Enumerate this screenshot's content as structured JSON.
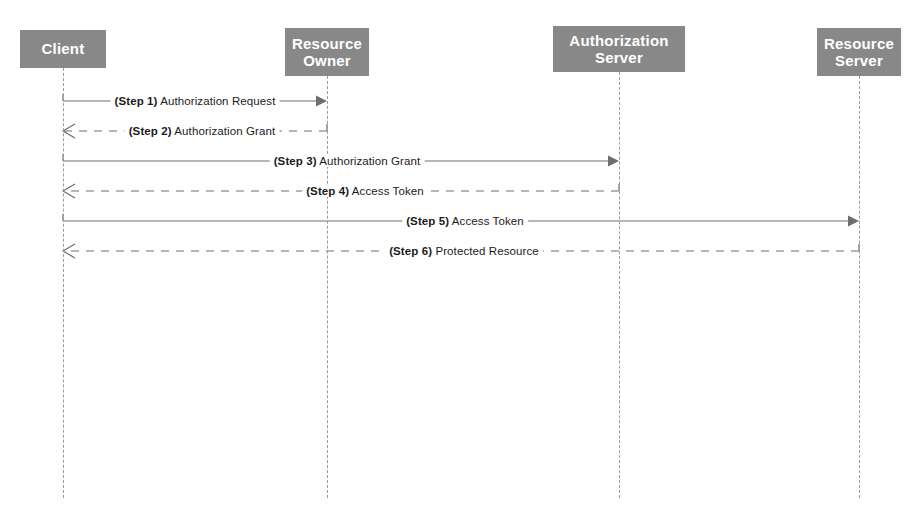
{
  "diagram": {
    "type": "uml-sequence-diagram",
    "canvas": {
      "width": 923,
      "height": 516
    },
    "colors": {
      "participant_fill": "#888888",
      "participant_text": "#ffffff",
      "line": "#6e6e6e",
      "lifeline": "#9a9a9a",
      "label_text": "#1b1b1b",
      "background": "#ffffff"
    }
  },
  "participants": [
    {
      "id": "client",
      "label": "Client",
      "x": 20,
      "y": 30,
      "width": 86,
      "height": 38,
      "lifeline_x": 63,
      "lifeline_top": 68,
      "lifeline_bottom": 498
    },
    {
      "id": "resource-owner",
      "label": "Resource\nOwner",
      "x": 285,
      "y": 28,
      "width": 84,
      "height": 48,
      "lifeline_x": 327,
      "lifeline_top": 76,
      "lifeline_bottom": 498
    },
    {
      "id": "authorization-server",
      "label": "Authorization\nServer",
      "x": 553,
      "y": 26,
      "width": 132,
      "height": 46,
      "lifeline_x": 619,
      "lifeline_top": 72,
      "lifeline_bottom": 498
    },
    {
      "id": "resource-server",
      "label": "Resource\nServer",
      "x": 817,
      "y": 28,
      "width": 84,
      "height": 48,
      "lifeline_x": 859,
      "lifeline_top": 76,
      "lifeline_bottom": 498
    }
  ],
  "messages": [
    {
      "step": "(Step 1)",
      "text": "Authorization Request",
      "from": "client",
      "to": "resource-owner",
      "x1": 63,
      "x2": 327,
      "y": 101,
      "direction": "right",
      "style": "solid",
      "arrowhead": "filled",
      "label_x": 195
    },
    {
      "step": "(Step 2)",
      "text": "Authorization Grant",
      "from": "resource-owner",
      "to": "client",
      "x1": 327,
      "x2": 63,
      "y": 131,
      "direction": "left",
      "style": "dashed",
      "arrowhead": "open",
      "label_x": 202
    },
    {
      "step": "(Step 3)",
      "text": "Authorization Grant",
      "from": "client",
      "to": "authorization-server",
      "x1": 63,
      "x2": 619,
      "y": 161,
      "direction": "right",
      "style": "solid",
      "arrowhead": "filled",
      "label_x": 347
    },
    {
      "step": "(Step 4)",
      "text": "Access Token",
      "from": "authorization-server",
      "to": "client",
      "x1": 619,
      "x2": 63,
      "y": 191,
      "direction": "left",
      "style": "dashed",
      "arrowhead": "open",
      "label_x": 365
    },
    {
      "step": "(Step 5)",
      "text": "Access Token",
      "from": "client",
      "to": "resource-server",
      "x1": 63,
      "x2": 859,
      "y": 221,
      "direction": "right",
      "style": "solid",
      "arrowhead": "filled",
      "label_x": 465
    },
    {
      "step": "(Step 6)",
      "text": "Protected Resource",
      "from": "resource-server",
      "to": "client",
      "x1": 859,
      "x2": 63,
      "y": 251,
      "direction": "left",
      "style": "dashed",
      "arrowhead": "open",
      "label_x": 464
    }
  ]
}
